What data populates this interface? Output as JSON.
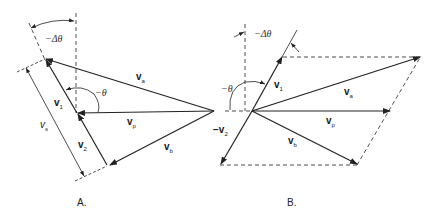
{
  "panels": [
    {
      "id": "A",
      "caption": "A.",
      "labels": {
        "delta_theta": "−Δθ",
        "theta": "−θ",
        "v1": "v",
        "v1_sub": "1",
        "v2": "v",
        "v2_sub": "2",
        "va": "v",
        "va_sub": "a",
        "vp": "v",
        "vp_sub": "p",
        "vb": "v",
        "vb_sub": "b",
        "vs": "v",
        "vs_sub": "s"
      }
    },
    {
      "id": "B",
      "caption": "B.",
      "labels": {
        "delta_theta": "−Δθ",
        "theta": "−θ",
        "v1": "v",
        "v1_sub": "1",
        "neg_v2": "−v",
        "neg_v2_sub": "2",
        "va": "v",
        "va_sub": "a",
        "vp": "v",
        "vp_sub": "p",
        "vb": "v",
        "vb_sub": "b"
      }
    }
  ],
  "colors": {
    "line": "#222222",
    "background": "#ffffff"
  }
}
